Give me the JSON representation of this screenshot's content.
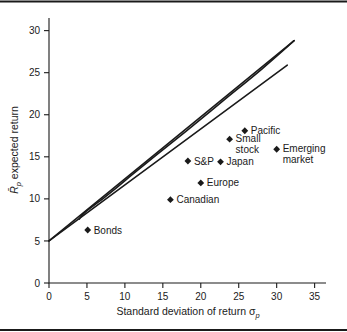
{
  "chart_data": {
    "type": "scatter",
    "title": "",
    "subtitle": "",
    "xlabel": "Standard deviation of return",
    "xlabel_symbol": "σ",
    "xlabel_symbol_sub": "p",
    "ylabel": "expected return",
    "ylabel_symbol": "R̄",
    "ylabel_symbol_sub": "p",
    "xlim": [
      0,
      36.5
    ],
    "ylim": [
      0,
      31.5
    ],
    "xticks": [
      0,
      5,
      10,
      15,
      20,
      25,
      30,
      35
    ],
    "yticks": [
      0,
      5,
      10,
      15,
      20,
      25,
      30
    ],
    "xtick_labels": [
      "0",
      "5",
      "10",
      "15",
      "20",
      "25",
      "30",
      "35"
    ],
    "ytick_labels": [
      "0",
      "5",
      "10",
      "15",
      "20",
      "25",
      "30"
    ],
    "grid": false,
    "legend": "none",
    "points": [
      {
        "name": "Bonds",
        "label": "Bonds",
        "x": 5.1,
        "y": 6.3,
        "label_dx": 6,
        "label_dy": 3.5,
        "label_anchor": "start",
        "label_lines": [
          "Bonds"
        ]
      },
      {
        "name": "Canadian",
        "label": "Canadian",
        "x": 16.0,
        "y": 9.9,
        "label_dx": 6,
        "label_dy": 3.5,
        "label_anchor": "start",
        "label_lines": [
          "Canadian"
        ]
      },
      {
        "name": "Europe",
        "label": "Europe",
        "x": 20.0,
        "y": 11.9,
        "label_dx": 6,
        "label_dy": 3.5,
        "label_anchor": "start",
        "label_lines": [
          "Europe"
        ]
      },
      {
        "name": "S&P",
        "label": "S&P",
        "x": 18.3,
        "y": 14.5,
        "label_dx": 6,
        "label_dy": 3.5,
        "label_anchor": "start",
        "label_lines": [
          "S&P"
        ]
      },
      {
        "name": "Japan",
        "label": "Japan",
        "x": 22.6,
        "y": 14.4,
        "label_dx": 6,
        "label_dy": 3.5,
        "label_anchor": "start",
        "label_lines": [
          "Japan"
        ]
      },
      {
        "name": "Small stock",
        "label": "Small stock",
        "x": 23.8,
        "y": 17.1,
        "label_dx": 6,
        "label_dy": 3.0,
        "label_anchor": "start",
        "label_lines": [
          "Small",
          "stock"
        ]
      },
      {
        "name": "Pacific",
        "label": "Pacific",
        "x": 25.8,
        "y": 18.1,
        "label_dx": 6,
        "label_dy": 3.5,
        "label_anchor": "start",
        "label_lines": [
          "Pacific"
        ]
      },
      {
        "name": "Emerging market",
        "label": "Emerging market",
        "x": 30.0,
        "y": 15.9,
        "label_dx": 6,
        "label_dy": 3.0,
        "label_anchor": "start",
        "label_lines": [
          "Emerging",
          "market"
        ]
      }
    ],
    "lines": [
      {
        "name": "capital-market-line-upper",
        "description": "Tangent line from risk-free rate through the tangency portfolio (upper)",
        "points": [
          [
            0,
            5.0
          ],
          [
            32.3,
            28.8
          ]
        ]
      },
      {
        "name": "capital-market-line-lower",
        "description": "Second tangent line (lower)",
        "points": [
          [
            0,
            5.0
          ],
          [
            31.4,
            25.9
          ]
        ]
      }
    ],
    "curves": [
      {
        "name": "efficient-frontier",
        "description": "Minimum-variance frontier of risky assets",
        "points": [
          [
            4.0,
            7.6
          ],
          [
            4.3,
            8.0
          ],
          [
            5.0,
            8.6
          ],
          [
            6.0,
            9.3
          ],
          [
            7.2,
            10.1
          ],
          [
            9.0,
            11.4
          ],
          [
            11.0,
            12.9
          ],
          [
            14.0,
            15.1
          ],
          [
            18.0,
            18.0
          ],
          [
            23.0,
            21.7
          ],
          [
            28.0,
            25.4
          ],
          [
            32.3,
            28.8
          ]
        ]
      }
    ],
    "risk_free_rate": 5.0,
    "annotations": []
  }
}
